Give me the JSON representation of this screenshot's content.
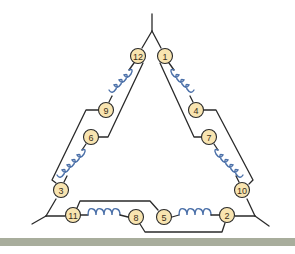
{
  "diagram": {
    "type": "delta-connected twelve-lead motor winding",
    "colors": {
      "wire": "#2a2a2a",
      "coil": "#4a6fa8",
      "terminal_fill": "#f8e4b0",
      "bottom_bar": "#a8ad9c"
    },
    "terminals": [
      {
        "id": "t12",
        "label": "12"
      },
      {
        "id": "t1",
        "label": "1"
      },
      {
        "id": "t9",
        "label": "9"
      },
      {
        "id": "t4",
        "label": "4"
      },
      {
        "id": "t6",
        "label": "6"
      },
      {
        "id": "t7",
        "label": "7"
      },
      {
        "id": "t3",
        "label": "3"
      },
      {
        "id": "t10",
        "label": "10"
      },
      {
        "id": "t11",
        "label": "11"
      },
      {
        "id": "t8",
        "label": "8"
      },
      {
        "id": "t5",
        "label": "5"
      },
      {
        "id": "t2",
        "label": "2"
      }
    ]
  }
}
